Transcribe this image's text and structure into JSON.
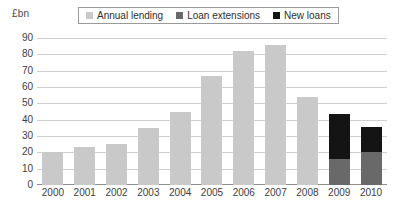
{
  "chart_data": {
    "type": "bar",
    "title": "",
    "subtitle": "",
    "xlabel": "",
    "ylabel": "£bn",
    "ylim": [
      0,
      90
    ],
    "ytick_step": 10,
    "yticks": [
      "90",
      "80",
      "70",
      "60",
      "50",
      "40",
      "30",
      "20",
      "10",
      "0"
    ],
    "grid": true,
    "stacked": true,
    "legend_position": "top",
    "categories": [
      "2000",
      "2001",
      "2002",
      "2003",
      "2004",
      "2005",
      "2006",
      "2007",
      "2008",
      "2009",
      "2010"
    ],
    "series": [
      {
        "name": "Annual lending",
        "color": "#c9c9c9",
        "values": [
          20,
          23,
          25,
          35,
          45,
          67,
          82,
          85.5,
          54,
          null,
          null
        ]
      },
      {
        "name": "Loan extensions",
        "color": "#696969",
        "values": [
          null,
          null,
          null,
          null,
          null,
          null,
          null,
          null,
          null,
          16,
          20
        ]
      },
      {
        "name": "New loans",
        "color": "#141414",
        "values": [
          null,
          null,
          null,
          null,
          null,
          null,
          null,
          null,
          null,
          27.5,
          15.5
        ]
      }
    ],
    "totals": [
      20,
      23,
      25,
      35,
      45,
      67,
      82,
      85.5,
      54,
      43.5,
      35.5
    ],
    "colors": {
      "grid": "#cfcfcf",
      "axis": "#8e8e8e",
      "text": "#3d3d3d",
      "background": "#ffffff"
    }
  },
  "legend": {
    "items": [
      {
        "label": "Annual lending",
        "color": "#c9c9c9"
      },
      {
        "label": "Loan extensions",
        "color": "#696969"
      },
      {
        "label": "New loans",
        "color": "#141414"
      }
    ]
  },
  "axis_unit": "£bn"
}
